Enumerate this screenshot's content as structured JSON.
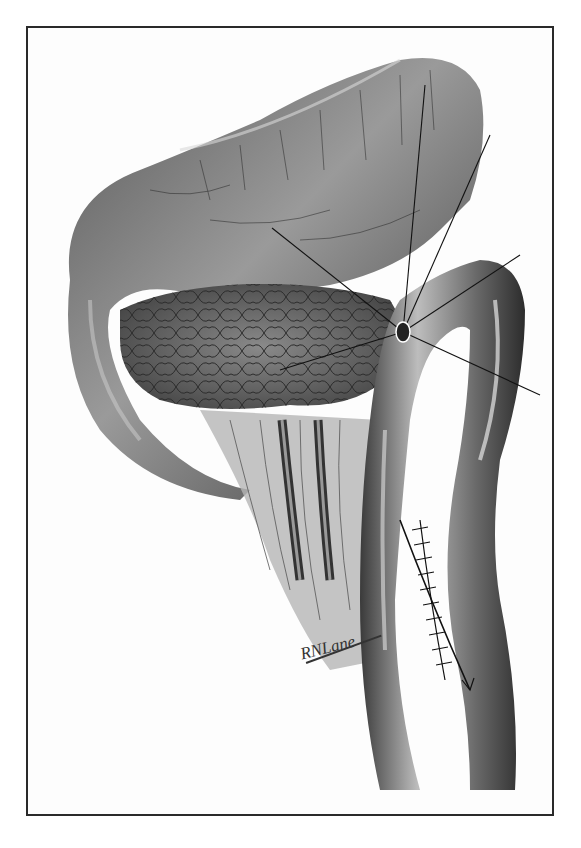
{
  "illustration": {
    "subject": "Surgical anatomical illustration: stomach, pancreas and jejunal loop with sutured anastomosis",
    "style": "monochrome engraving / pen-and-ink with halftone shading",
    "signature": "RNLane",
    "colors": {
      "background": "#ffffff",
      "frame": "#2a2a2a",
      "dark_tone": "#2e2e2e",
      "mid_tone": "#7a7a7a",
      "light_tone": "#d6d6d6"
    }
  }
}
